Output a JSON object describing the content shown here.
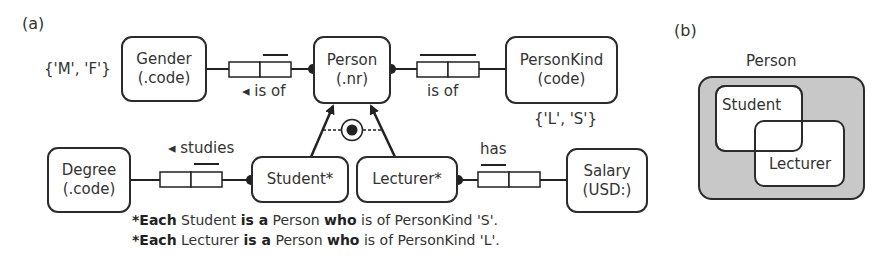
{
  "panels": {
    "a_label": "(a)",
    "b_label": "(b)"
  },
  "entities": {
    "gender": {
      "name": "Gender",
      "ref": "(.code)",
      "values": "{'M', 'F'}"
    },
    "person": {
      "name": "Person",
      "ref": "(.nr)"
    },
    "person_kind": {
      "name": "PersonKind",
      "ref": "(code)",
      "values": "{'L', 'S'}"
    },
    "degree": {
      "name": "Degree",
      "ref": "(.code)"
    },
    "student": {
      "name": "Student*"
    },
    "lecturer": {
      "name": "Lecturer*"
    },
    "salary": {
      "name": "Salary",
      "ref": "(USD:)"
    }
  },
  "fact_types": {
    "person_gender": {
      "reading": "◂ is of"
    },
    "person_kind": {
      "reading": "is of"
    },
    "student_degree": {
      "reading": "◂ studies"
    },
    "lecturer_salary": {
      "reading": "has"
    }
  },
  "subtype_constraint": {
    "symbol": "exclusive-or / total union",
    "type": "circled-dot"
  },
  "definitions": [
    {
      "star": "*",
      "each": "Each",
      "subject": "Student",
      "is_a": "is a",
      "super": "Person",
      "who": "who",
      "rest": "is of PersonKind 'S'."
    },
    {
      "star": "*",
      "each": "Each",
      "subject": "Lecturer",
      "is_a": "is a",
      "super": "Person",
      "who": "who",
      "rest": "is of PersonKind 'L'."
    }
  ],
  "venn": {
    "outer_label": "Person",
    "student_label": "Student",
    "lecturer_label": "Lecturer",
    "outer_fill": "#c8c8c8",
    "inner_fill": "#ffffff"
  }
}
